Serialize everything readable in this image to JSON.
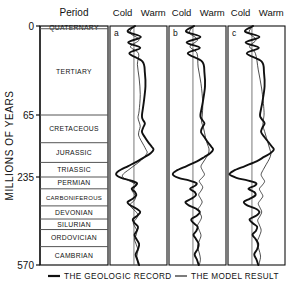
{
  "figure": {
    "yaxis_title": "MILLIONS OF YEARS",
    "period_header": "Period",
    "tick_labels": [
      "0",
      "65",
      "235",
      "570"
    ],
    "tick_values": [
      0,
      65,
      235,
      570
    ]
  },
  "periods": [
    {
      "name": "QUATERNARY",
      "top": 0,
      "bottom": 2
    },
    {
      "name": "TERTIARY",
      "top": 2,
      "bottom": 65
    },
    {
      "name": "CRETACEOUS",
      "top": 65,
      "bottom": 141
    },
    {
      "name": "JURASSIC",
      "top": 141,
      "bottom": 195
    },
    {
      "name": "TRIASSIC",
      "top": 195,
      "bottom": 235
    },
    {
      "name": "PERMIAN",
      "top": 235,
      "bottom": 280
    },
    {
      "name": "CARBONIFEROUS",
      "top": 280,
      "bottom": 345
    },
    {
      "name": "DEVONIAN",
      "top": 345,
      "bottom": 395
    },
    {
      "name": "SILURIAN",
      "top": 395,
      "bottom": 435
    },
    {
      "name": "ORDOVICIAN",
      "top": 435,
      "bottom": 500
    },
    {
      "name": "CAMBRIAN",
      "top": 500,
      "bottom": 570
    }
  ],
  "panels": [
    {
      "id": "a",
      "cold_label": "Cold",
      "warm_label": "Warm"
    },
    {
      "id": "b",
      "cold_label": "Cold",
      "warm_label": "Warm"
    },
    {
      "id": "c",
      "cold_label": "Cold",
      "warm_label": "Warm"
    }
  ],
  "legend": [
    {
      "label": "THE GEOLOGIC RECORD",
      "style": "thick"
    },
    {
      "label": "THE MODEL RESULT",
      "style": "thin"
    }
  ],
  "colors": {
    "line": "#111111",
    "frame": "#555555",
    "background": "#ffffff"
  },
  "chart_data": {
    "type": "line",
    "title": "",
    "xlabel": "Cold ↔ Warm",
    "ylabel": "MILLIONS OF YEARS",
    "ylim": [
      0,
      287
    ],
    "y_tick_labels": [
      "0",
      "65",
      "235",
      "570"
    ],
    "y_tick_pixels": [
      26,
      115,
      177,
      265
    ],
    "grid": false,
    "legend_position": "bottom",
    "axis_direction": "y-inverted (0 Ma at top, 570 Ma at bottom)",
    "note": "Three side-by-side panels a, b, c. Each plots palaeo-temperature on the horizontal axis (left = Cold, right = Warm) against geologic time on the vertical axis. Thick line = the geologic record; thin line = the model result. Values below are relative temperature offsets in arbitrary units from the panel's vertical zero-reference line; positive = warm, negative = cold.",
    "series": [
      {
        "panel": "a",
        "name": "THE GEOLOGIC RECORD",
        "style": "thick",
        "points": [
          [
            0.1,
            0
          ],
          [
            -0.55,
            4
          ],
          [
            0.6,
            8
          ],
          [
            -0.5,
            12
          ],
          [
            0.55,
            16
          ],
          [
            -0.4,
            20
          ],
          [
            0.75,
            26
          ],
          [
            0.95,
            34
          ],
          [
            1.0,
            44
          ],
          [
            0.85,
            56
          ],
          [
            0.7,
            65
          ],
          [
            0.75,
            76
          ],
          [
            0.95,
            88
          ],
          [
            0.8,
            100
          ],
          [
            0.7,
            112
          ],
          [
            0.95,
            126
          ],
          [
            1.25,
            140
          ],
          [
            1.55,
            152
          ],
          [
            1.7,
            160
          ],
          [
            1.45,
            170
          ],
          [
            0.95,
            180
          ],
          [
            0.3,
            192
          ],
          [
            -0.5,
            205
          ],
          [
            -1.3,
            218
          ],
          [
            -1.55,
            228
          ],
          [
            -1.1,
            238
          ],
          [
            -0.3,
            248
          ],
          [
            0.25,
            258
          ],
          [
            0.15,
            268
          ],
          [
            -0.2,
            280
          ],
          [
            0.1,
            292
          ],
          [
            0.2,
            305
          ],
          [
            -0.1,
            318
          ],
          [
            -0.55,
            330
          ],
          [
            -0.35,
            342
          ],
          [
            0.2,
            355
          ],
          [
            0.55,
            368
          ],
          [
            0.3,
            382
          ],
          [
            -0.1,
            396
          ],
          [
            0.05,
            410
          ],
          [
            0.35,
            424
          ],
          [
            0.25,
            440
          ],
          [
            0.05,
            455
          ],
          [
            0.2,
            470
          ],
          [
            0.45,
            490
          ],
          [
            0.35,
            510
          ],
          [
            0.15,
            530
          ],
          [
            0.3,
            550
          ],
          [
            0.45,
            570
          ]
        ]
      },
      {
        "panel": "a",
        "name": "THE MODEL RESULT",
        "style": "thin",
        "points": [
          [
            0.05,
            0
          ],
          [
            -0.35,
            5
          ],
          [
            0.45,
            10
          ],
          [
            -0.3,
            15
          ],
          [
            0.4,
            20
          ],
          [
            0.3,
            28
          ],
          [
            0.45,
            38
          ],
          [
            0.55,
            50
          ],
          [
            0.45,
            62
          ],
          [
            0.35,
            72
          ],
          [
            0.45,
            84
          ],
          [
            0.55,
            96
          ],
          [
            0.45,
            108
          ],
          [
            0.4,
            120
          ],
          [
            0.6,
            134
          ],
          [
            0.85,
            148
          ],
          [
            1.05,
            160
          ],
          [
            1.15,
            168
          ],
          [
            0.95,
            178
          ],
          [
            0.6,
            190
          ],
          [
            0.1,
            202
          ],
          [
            -0.45,
            215
          ],
          [
            -0.9,
            226
          ],
          [
            -1.0,
            234
          ],
          [
            -0.7,
            244
          ],
          [
            -0.2,
            254
          ],
          [
            0.15,
            264
          ],
          [
            0.05,
            275
          ],
          [
            -0.15,
            288
          ],
          [
            0.05,
            300
          ],
          [
            0.15,
            314
          ],
          [
            -0.05,
            328
          ],
          [
            -0.35,
            340
          ],
          [
            -0.2,
            352
          ],
          [
            0.15,
            366
          ],
          [
            0.35,
            380
          ],
          [
            0.2,
            394
          ],
          [
            -0.05,
            408
          ],
          [
            0.05,
            422
          ],
          [
            0.25,
            438
          ],
          [
            0.2,
            455
          ],
          [
            0.05,
            472
          ],
          [
            0.2,
            492
          ],
          [
            0.35,
            514
          ],
          [
            0.25,
            536
          ],
          [
            0.3,
            556
          ],
          [
            0.4,
            570
          ]
        ]
      },
      {
        "panel": "b",
        "name": "THE GEOLOGIC RECORD",
        "style": "thick",
        "points": [
          [
            0.1,
            0
          ],
          [
            -0.6,
            4
          ],
          [
            0.65,
            8
          ],
          [
            -0.55,
            12
          ],
          [
            0.6,
            16
          ],
          [
            -0.45,
            20
          ],
          [
            0.8,
            26
          ],
          [
            1.0,
            34
          ],
          [
            1.05,
            44
          ],
          [
            0.85,
            56
          ],
          [
            0.65,
            65
          ],
          [
            0.75,
            76
          ],
          [
            1.0,
            88
          ],
          [
            0.8,
            100
          ],
          [
            0.7,
            112
          ],
          [
            1.0,
            126
          ],
          [
            1.3,
            140
          ],
          [
            1.6,
            152
          ],
          [
            1.75,
            160
          ],
          [
            1.5,
            170
          ],
          [
            1.0,
            180
          ],
          [
            0.35,
            192
          ],
          [
            -0.55,
            205
          ],
          [
            -1.45,
            218
          ],
          [
            -1.75,
            228
          ],
          [
            -1.25,
            238
          ],
          [
            -0.35,
            248
          ],
          [
            0.3,
            258
          ],
          [
            0.2,
            268
          ],
          [
            -0.25,
            280
          ],
          [
            0.15,
            292
          ],
          [
            0.25,
            305
          ],
          [
            -0.15,
            318
          ],
          [
            -0.65,
            330
          ],
          [
            -0.4,
            342
          ],
          [
            0.25,
            355
          ],
          [
            0.6,
            368
          ],
          [
            0.35,
            382
          ],
          [
            -0.15,
            396
          ],
          [
            0.05,
            410
          ],
          [
            0.4,
            424
          ],
          [
            0.3,
            440
          ],
          [
            0.05,
            455
          ],
          [
            0.25,
            470
          ],
          [
            0.5,
            490
          ],
          [
            0.4,
            510
          ],
          [
            0.15,
            530
          ],
          [
            0.35,
            550
          ],
          [
            0.5,
            570
          ]
        ]
      },
      {
        "panel": "b",
        "name": "THE MODEL RESULT",
        "style": "thin",
        "points": [
          [
            0.05,
            0
          ],
          [
            -0.3,
            5
          ],
          [
            0.4,
            10
          ],
          [
            -0.25,
            15
          ],
          [
            0.35,
            20
          ],
          [
            0.45,
            30
          ],
          [
            0.7,
            42
          ],
          [
            0.85,
            56
          ],
          [
            0.8,
            70
          ],
          [
            0.75,
            84
          ],
          [
            0.9,
            98
          ],
          [
            1.0,
            112
          ],
          [
            1.1,
            128
          ],
          [
            1.25,
            144
          ],
          [
            1.4,
            158
          ],
          [
            1.35,
            170
          ],
          [
            1.15,
            182
          ],
          [
            0.9,
            194
          ],
          [
            0.7,
            206
          ],
          [
            0.85,
            218
          ],
          [
            1.0,
            228
          ],
          [
            0.8,
            238
          ],
          [
            0.55,
            250
          ],
          [
            0.7,
            262
          ],
          [
            0.85,
            274
          ],
          [
            0.7,
            288
          ],
          [
            0.5,
            302
          ],
          [
            0.65,
            316
          ],
          [
            0.8,
            330
          ],
          [
            0.65,
            344
          ],
          [
            0.45,
            358
          ],
          [
            0.6,
            372
          ],
          [
            0.75,
            388
          ],
          [
            0.6,
            404
          ],
          [
            0.4,
            420
          ],
          [
            0.55,
            438
          ],
          [
            0.7,
            458
          ],
          [
            0.55,
            478
          ],
          [
            0.4,
            500
          ],
          [
            0.55,
            524
          ],
          [
            0.65,
            548
          ],
          [
            0.55,
            570
          ]
        ]
      },
      {
        "panel": "c",
        "name": "THE GEOLOGIC RECORD",
        "style": "thick",
        "points": [
          [
            0.1,
            0
          ],
          [
            -0.6,
            4
          ],
          [
            0.65,
            8
          ],
          [
            -0.55,
            12
          ],
          [
            0.6,
            16
          ],
          [
            -0.45,
            20
          ],
          [
            0.85,
            26
          ],
          [
            1.05,
            34
          ],
          [
            1.1,
            44
          ],
          [
            0.9,
            56
          ],
          [
            0.7,
            65
          ],
          [
            0.85,
            76
          ],
          [
            1.1,
            88
          ],
          [
            0.9,
            100
          ],
          [
            0.8,
            112
          ],
          [
            1.1,
            126
          ],
          [
            1.45,
            140
          ],
          [
            1.75,
            152
          ],
          [
            1.9,
            160
          ],
          [
            1.6,
            170
          ],
          [
            1.05,
            180
          ],
          [
            0.4,
            192
          ],
          [
            -0.6,
            205
          ],
          [
            -1.6,
            218
          ],
          [
            -1.95,
            228
          ],
          [
            -1.35,
            238
          ],
          [
            -0.4,
            248
          ],
          [
            0.35,
            258
          ],
          [
            0.25,
            268
          ],
          [
            -0.3,
            280
          ],
          [
            0.2,
            292
          ],
          [
            0.3,
            305
          ],
          [
            -0.2,
            318
          ],
          [
            -0.7,
            330
          ],
          [
            -0.45,
            342
          ],
          [
            0.3,
            355
          ],
          [
            0.65,
            368
          ],
          [
            0.4,
            382
          ],
          [
            -0.2,
            396
          ],
          [
            0.05,
            410
          ],
          [
            0.45,
            424
          ],
          [
            0.35,
            440
          ],
          [
            0.05,
            455
          ],
          [
            0.3,
            470
          ],
          [
            0.55,
            490
          ],
          [
            0.45,
            510
          ],
          [
            0.2,
            530
          ],
          [
            0.4,
            550
          ],
          [
            0.55,
            570
          ]
        ]
      },
      {
        "panel": "c",
        "name": "THE MODEL RESULT",
        "style": "thin",
        "points": [
          [
            0.05,
            0
          ],
          [
            -0.25,
            5
          ],
          [
            0.35,
            10
          ],
          [
            -0.2,
            15
          ],
          [
            0.3,
            20
          ],
          [
            0.55,
            32
          ],
          [
            0.85,
            46
          ],
          [
            1.05,
            62
          ],
          [
            1.0,
            78
          ],
          [
            0.95,
            94
          ],
          [
            1.1,
            110
          ],
          [
            1.25,
            126
          ],
          [
            1.4,
            142
          ],
          [
            1.55,
            158
          ],
          [
            1.65,
            172
          ],
          [
            1.5,
            186
          ],
          [
            1.25,
            200
          ],
          [
            1.0,
            214
          ],
          [
            0.8,
            228
          ],
          [
            0.95,
            240
          ],
          [
            1.1,
            252
          ],
          [
            0.9,
            266
          ],
          [
            0.65,
            280
          ],
          [
            0.8,
            294
          ],
          [
            0.95,
            308
          ],
          [
            0.75,
            322
          ],
          [
            0.55,
            336
          ],
          [
            0.7,
            352
          ],
          [
            0.85,
            368
          ],
          [
            0.7,
            384
          ],
          [
            0.5,
            400
          ],
          [
            0.65,
            418
          ],
          [
            0.8,
            438
          ],
          [
            0.65,
            460
          ],
          [
            0.45,
            484
          ],
          [
            0.6,
            510
          ],
          [
            0.75,
            536
          ],
          [
            0.65,
            560
          ],
          [
            0.6,
            570
          ]
        ]
      }
    ]
  }
}
